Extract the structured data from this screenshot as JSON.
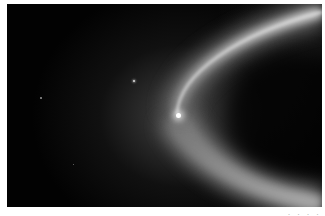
{
  "image": {
    "subject": "Saturn E ring with Enceladus",
    "colors": {
      "background": "#020202",
      "frame": "#ffffff",
      "ring_peak": "#d8d8d8",
      "moon": "#ffffff"
    }
  },
  "caption": {
    "text": "· · · ·"
  }
}
